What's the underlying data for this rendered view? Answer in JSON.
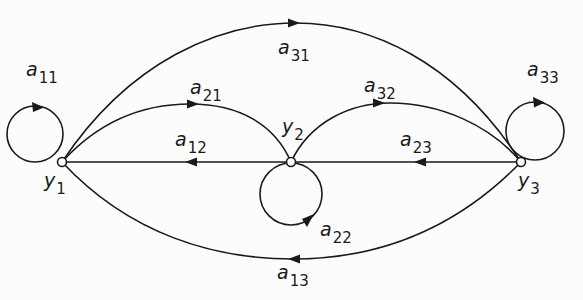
{
  "diagram": {
    "type": "signal-flow-graph",
    "colors": {
      "ink": "#1a1a1a",
      "background": "#fcfcfc",
      "node_fill": "#ffffff"
    },
    "nodes": [
      {
        "id": "y1",
        "base": "y",
        "sub": "1",
        "x": 62,
        "y": 162
      },
      {
        "id": "y2",
        "base": "y",
        "sub": "2",
        "x": 291,
        "y": 162
      },
      {
        "id": "y3",
        "base": "y",
        "sub": "3",
        "x": 521,
        "y": 162
      }
    ],
    "edges": [
      {
        "id": "a11",
        "base": "a",
        "sub": "11",
        "from": "y1",
        "to": "y1",
        "kind": "self-loop"
      },
      {
        "id": "a21",
        "base": "a",
        "sub": "21",
        "from": "y1",
        "to": "y2",
        "kind": "upper-arc"
      },
      {
        "id": "a12",
        "base": "a",
        "sub": "12",
        "from": "y2",
        "to": "y1",
        "kind": "straight"
      },
      {
        "id": "a22",
        "base": "a",
        "sub": "22",
        "from": "y2",
        "to": "y2",
        "kind": "self-loop"
      },
      {
        "id": "a32",
        "base": "a",
        "sub": "32",
        "from": "y2",
        "to": "y3",
        "kind": "upper-arc"
      },
      {
        "id": "a23",
        "base": "a",
        "sub": "23",
        "from": "y3",
        "to": "y2",
        "kind": "straight"
      },
      {
        "id": "a33",
        "base": "a",
        "sub": "33",
        "from": "y3",
        "to": "y3",
        "kind": "self-loop"
      },
      {
        "id": "a31",
        "base": "a",
        "sub": "31",
        "from": "y1",
        "to": "y3",
        "kind": "outer-upper-arc"
      },
      {
        "id": "a13",
        "base": "a",
        "sub": "13",
        "from": "y3",
        "to": "y1",
        "kind": "outer-lower-arc"
      }
    ]
  },
  "labels": {
    "a11": {
      "base": "a",
      "sub": "11"
    },
    "a21": {
      "base": "a",
      "sub": "21"
    },
    "a12": {
      "base": "a",
      "sub": "12"
    },
    "a22": {
      "base": "a",
      "sub": "22"
    },
    "a32": {
      "base": "a",
      "sub": "32"
    },
    "a23": {
      "base": "a",
      "sub": "23"
    },
    "a33": {
      "base": "a",
      "sub": "33"
    },
    "a31": {
      "base": "a",
      "sub": "31"
    },
    "a13": {
      "base": "a",
      "sub": "13"
    },
    "y1": {
      "base": "y",
      "sub": "1"
    },
    "y2": {
      "base": "y",
      "sub": "2"
    },
    "y3": {
      "base": "y",
      "sub": "3"
    }
  }
}
